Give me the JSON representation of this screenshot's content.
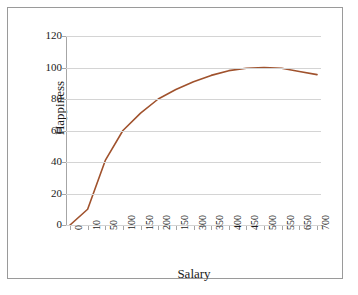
{
  "chart_data": {
    "type": "line",
    "title": "",
    "xlabel": "Salary",
    "ylabel": "Happiness",
    "ylim": [
      0,
      120
    ],
    "yticks": [
      0,
      20,
      40,
      60,
      80,
      100,
      120
    ],
    "grid": true,
    "legend": "none",
    "line_color": "#A0522D",
    "categories": [
      "0",
      "10",
      "50",
      "100",
      "150",
      "200",
      "150",
      "300",
      "350",
      "400",
      "450",
      "500",
      "550",
      "650",
      "700"
    ],
    "values": [
      0,
      10,
      41,
      60,
      71,
      80,
      86,
      91,
      95,
      98,
      99.5,
      100,
      99.5,
      97.5,
      95.5
    ],
    "series": [
      {
        "name": "Happiness",
        "values": [
          0,
          10,
          41,
          60,
          71,
          80,
          86,
          91,
          95,
          98,
          99.5,
          100,
          99.5,
          97.5,
          95.5
        ]
      }
    ]
  },
  "axes": {
    "y_tick_labels": [
      "120",
      "100",
      "80",
      "60",
      "40",
      "20",
      "0"
    ],
    "x_tick_labels": [
      "0",
      "10",
      "50",
      "100",
      "150",
      "200",
      "150",
      "300",
      "350",
      "400",
      "450",
      "500",
      "550",
      "650",
      "700"
    ],
    "y_axis_title": "Happiness",
    "x_axis_title": "Salary"
  }
}
